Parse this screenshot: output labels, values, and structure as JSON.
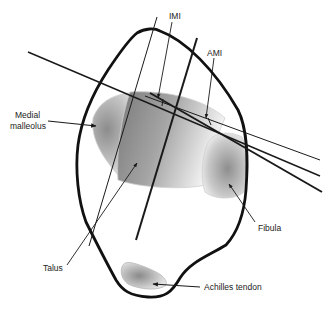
{
  "diagram": {
    "labels": {
      "imi": "IMI",
      "ami": "AMI",
      "medial_malleolus_1": "Medial",
      "medial_malleolus_2": "malleolus",
      "fibula": "Fibula",
      "talus": "Talus",
      "achilles_tendon": "Achilles tendon"
    },
    "colors": {
      "outline": "#111111",
      "line": "#1a1a1a",
      "bone_dark": "#8a8a8a",
      "bone_light": "#e6e6e6",
      "label": "#222222"
    }
  }
}
